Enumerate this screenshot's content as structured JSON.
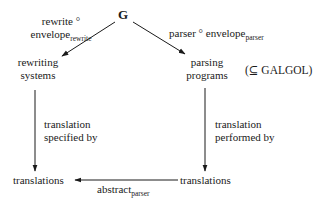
{
  "diagram": {
    "root": {
      "label": "G"
    },
    "left_edge": {
      "line1": "rewrite °",
      "line2_main": "envelope",
      "line2_sub": "rewrite"
    },
    "right_edge": {
      "main1": "parser ° envelope",
      "sub": "parser"
    },
    "left_node": {
      "line1": "rewriting",
      "line2": "systems"
    },
    "right_node": {
      "line1": "parsing",
      "line2": "programs"
    },
    "right_note": "(⊆ GALGOL)",
    "left_vertical_edge": {
      "line1": "translation",
      "line2": "specified by"
    },
    "right_vertical_edge": {
      "line1": "translation",
      "line2": "performed by"
    },
    "bottom_left_node": "translations",
    "bottom_right_node": "translations",
    "bottom_edge": {
      "main": "abstract",
      "sub": "parser"
    }
  }
}
